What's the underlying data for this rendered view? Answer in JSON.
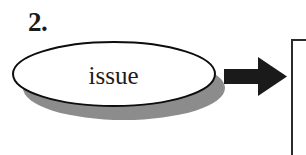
{
  "diagram": {
    "step_number": "2.",
    "node": {
      "shape": "ellipse",
      "label": "issue",
      "outline_color": "#0d0d0d",
      "fill_color": "#ffffff",
      "shadow_color": "#8c8c8c"
    },
    "arrow": {
      "name": "right-arrow",
      "direction": "right",
      "color": "#1a1a1a"
    },
    "next_box": {
      "name": "next-node-box",
      "border_color": "#2b2b2b",
      "fill_color": "#ffffff"
    },
    "background_color": "#ffffff"
  }
}
